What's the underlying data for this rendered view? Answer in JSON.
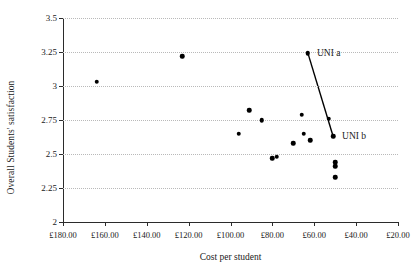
{
  "chart_data": {
    "type": "scatter",
    "title": "",
    "xlabel": "Cost per student",
    "ylabel": "Overall Students' satisfaction",
    "xlim": [
      180,
      20
    ],
    "ylim": [
      2,
      3.5
    ],
    "x_reversed": true,
    "grid": true,
    "legend": "none",
    "xticks": [
      180,
      160,
      140,
      120,
      100,
      80,
      60,
      40,
      20
    ],
    "xticklabels": [
      "£180.00",
      "£160.00",
      "£140.00",
      "£120.00",
      "£100.00",
      "£80.00",
      "£60.00",
      "£40.00",
      "£20.00"
    ],
    "yticks": [
      2,
      2.25,
      2.5,
      2.75,
      3,
      3.25,
      3.5
    ],
    "yticklabels": [
      "2",
      "2.25",
      "2.5",
      "2.75",
      "3",
      "3.25",
      "3.5"
    ],
    "points": [
      {
        "x": 164,
        "y": 3.03
      },
      {
        "x": 123,
        "y": 3.22
      },
      {
        "x": 91,
        "y": 2.82
      },
      {
        "x": 85,
        "y": 2.75
      },
      {
        "x": 96,
        "y": 2.65
      },
      {
        "x": 80,
        "y": 2.47
      },
      {
        "x": 78,
        "y": 2.48
      },
      {
        "x": 66,
        "y": 2.79
      },
      {
        "x": 65,
        "y": 2.65
      },
      {
        "x": 70,
        "y": 2.58
      },
      {
        "x": 62,
        "y": 2.6
      },
      {
        "x": 53,
        "y": 2.76
      },
      {
        "x": 50,
        "y": 2.44
      },
      {
        "x": 50,
        "y": 2.41
      },
      {
        "x": 50,
        "y": 2.33
      },
      {
        "x": 63,
        "y": 3.24
      },
      {
        "x": 51,
        "y": 2.63
      }
    ],
    "annotations": [
      {
        "label": "UNI a",
        "x": 63,
        "y": 3.24,
        "label_dx": 9,
        "label_dy": -0.01
      },
      {
        "label": "UNI b",
        "x": 51,
        "y": 2.63,
        "label_dx": 9,
        "label_dy": -0.01
      }
    ],
    "connector": {
      "from": {
        "x": 63,
        "y": 3.24
      },
      "to": {
        "x": 51,
        "y": 2.63
      }
    }
  }
}
